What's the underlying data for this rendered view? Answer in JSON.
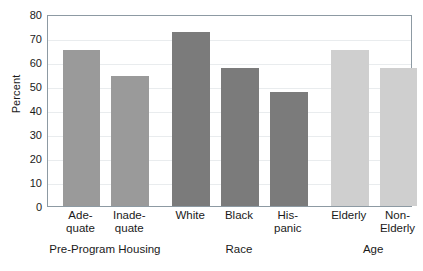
{
  "chart_data": {
    "type": "bar",
    "title": "",
    "xlabel": "",
    "ylabel": "Percent",
    "ylim": [
      0,
      80
    ],
    "ytick_step": 10,
    "yticks": [
      0,
      10,
      20,
      30,
      40,
      50,
      60,
      70,
      80
    ],
    "grid": true,
    "grid_axis": "y",
    "legend": "none",
    "categories": [
      "Ade-quate",
      "Inade-quate",
      "White",
      "Black",
      "His-panic",
      "Elderly",
      "Non-Elderly"
    ],
    "values": [
      65,
      54,
      72.5,
      57.5,
      47.5,
      65,
      57.5
    ],
    "bars": [
      {
        "label_line1": "Ade-",
        "label_line2": "quate",
        "value": 65,
        "group": "Pre-Program Housing",
        "color": "#9a9a9a"
      },
      {
        "label_line1": "Inade-",
        "label_line2": "quate",
        "value": 54,
        "group": "Pre-Program Housing",
        "color": "#9a9a9a"
      },
      {
        "label_line1": "White",
        "label_line2": "",
        "value": 72.5,
        "group": "Race",
        "color": "#7b7b7b"
      },
      {
        "label_line1": "Black",
        "label_line2": "",
        "value": 57.5,
        "group": "Race",
        "color": "#7b7b7b"
      },
      {
        "label_line1": "His-",
        "label_line2": "panic",
        "value": 47.5,
        "group": "Race",
        "color": "#7b7b7b"
      },
      {
        "label_line1": "Elderly",
        "label_line2": "",
        "value": 65,
        "group": "Age",
        "color": "#cfcfcf"
      },
      {
        "label_line1": "Non-",
        "label_line2": "Elderly",
        "value": 57.5,
        "group": "Age",
        "color": "#cfcfcf"
      }
    ],
    "groups": [
      {
        "label": "Pre-Program Housing",
        "color": "#9a9a9a"
      },
      {
        "label": "Race",
        "color": "#7b7b7b"
      },
      {
        "label": "Age",
        "color": "#cfcfcf"
      }
    ],
    "colors": {
      "group_housing": "#9a9a9a",
      "group_race": "#7b7b7b",
      "group_age": "#cfcfcf",
      "frame": "#8d9aa3",
      "gridline": "#e9ecee",
      "text": "#1a1a1a"
    }
  },
  "caption_fragment": ""
}
